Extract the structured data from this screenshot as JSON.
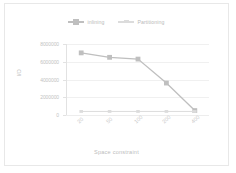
{
  "chart_data": {
    "type": "line",
    "title": "",
    "xlabel": "Space constraint",
    "ylabel": "I/O",
    "categories": [
      "20",
      "50",
      "100",
      "200",
      "400"
    ],
    "series": [
      {
        "name": "inlining",
        "values": [
          7000000,
          6500000,
          6300000,
          3600000,
          500000
        ],
        "color": "#bfbfbf",
        "marker": "square"
      },
      {
        "name": "Partitioning",
        "values": [
          400000,
          400000,
          400000,
          400000,
          400000
        ],
        "color": "#dcdcdc",
        "marker": "dash"
      }
    ],
    "ylim": [
      0,
      8000000
    ],
    "yticks": [
      "0",
      "2000000",
      "4000000",
      "6000000",
      "8000000"
    ],
    "ytick_values": [
      0,
      2000000,
      4000000,
      6000000,
      8000000
    ],
    "grid": "horizontal",
    "legend_position": "top"
  },
  "colors": {
    "series_1": "#bfbfbf",
    "series_2": "#dcdcdc",
    "gridline": "#f0f0f0",
    "axis": "#e2e2e2",
    "text": "#c2c2c2",
    "border": "#e8e8e8"
  }
}
